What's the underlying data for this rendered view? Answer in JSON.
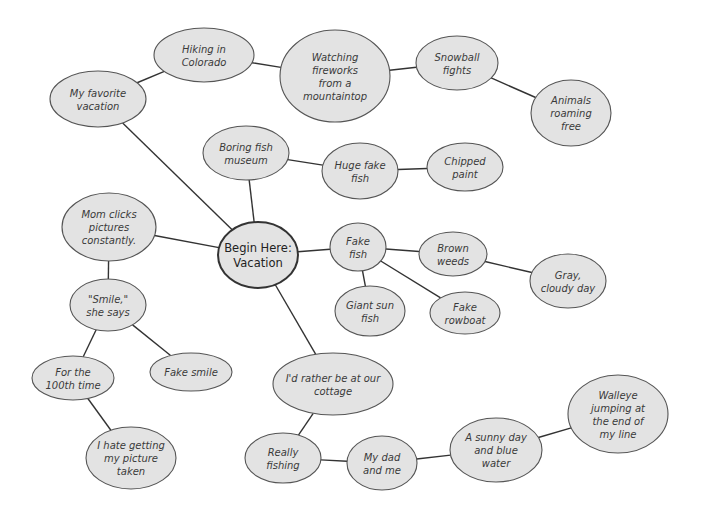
{
  "diagram": {
    "type": "mind-map / cluster web",
    "center_id": "center",
    "colors": {
      "node_fill": "#e3e3e3",
      "node_stroke": "#555555",
      "center_stroke": "#333333",
      "edge": "#333333",
      "text": "#3a3a3a"
    },
    "nodes": [
      {
        "id": "center",
        "lines": [
          "Begin Here:",
          "Vacation"
        ],
        "cx": 258,
        "cy": 255,
        "rx": 40,
        "ry": 33
      },
      {
        "id": "favorite",
        "lines": [
          "My favorite",
          "vacation"
        ],
        "cx": 98,
        "cy": 99,
        "rx": 48,
        "ry": 28
      },
      {
        "id": "hiking",
        "lines": [
          "Hiking in",
          "Colorado"
        ],
        "cx": 204,
        "cy": 55,
        "rx": 50,
        "ry": 27
      },
      {
        "id": "fireworks",
        "lines": [
          "Watching",
          "fireworks",
          "from a",
          "mountaintop"
        ],
        "cx": 335,
        "cy": 76,
        "rx": 55,
        "ry": 46
      },
      {
        "id": "snowball",
        "lines": [
          "Snowball",
          "fights"
        ],
        "cx": 457,
        "cy": 63,
        "rx": 41,
        "ry": 27
      },
      {
        "id": "animals",
        "lines": [
          "Animals",
          "roaming",
          "free"
        ],
        "cx": 571,
        "cy": 113,
        "rx": 40,
        "ry": 33
      },
      {
        "id": "museum",
        "lines": [
          "Boring fish",
          "museum"
        ],
        "cx": 246,
        "cy": 153,
        "rx": 43,
        "ry": 27
      },
      {
        "id": "hugefish",
        "lines": [
          "Huge fake",
          "fish"
        ],
        "cx": 360,
        "cy": 171,
        "rx": 38,
        "ry": 28
      },
      {
        "id": "chipped",
        "lines": [
          "Chipped",
          "paint"
        ],
        "cx": 465,
        "cy": 167,
        "rx": 38,
        "ry": 24
      },
      {
        "id": "fakefish",
        "lines": [
          "Fake",
          "fish"
        ],
        "cx": 358,
        "cy": 247,
        "rx": 28,
        "ry": 24
      },
      {
        "id": "weeds",
        "lines": [
          "Brown",
          "weeds"
        ],
        "cx": 453,
        "cy": 254,
        "rx": 34,
        "ry": 22
      },
      {
        "id": "gray",
        "lines": [
          "Gray,",
          "cloudy day"
        ],
        "cx": 568,
        "cy": 281,
        "rx": 38,
        "ry": 27
      },
      {
        "id": "sunfish",
        "lines": [
          "Giant sun",
          "fish"
        ],
        "cx": 370,
        "cy": 311,
        "rx": 35,
        "ry": 25
      },
      {
        "id": "rowboat",
        "lines": [
          "Fake",
          "rowboat"
        ],
        "cx": 465,
        "cy": 313,
        "rx": 35,
        "ry": 21
      },
      {
        "id": "mom",
        "lines": [
          "Mom clicks",
          "pictures",
          "constantly."
        ],
        "cx": 109,
        "cy": 227,
        "rx": 47,
        "ry": 34
      },
      {
        "id": "smile",
        "lines": [
          "\"Smile,\"",
          "she says"
        ],
        "cx": 108,
        "cy": 305,
        "rx": 38,
        "ry": 26
      },
      {
        "id": "hundredth",
        "lines": [
          "For the",
          "100th time"
        ],
        "cx": 73,
        "cy": 378,
        "rx": 41,
        "ry": 22
      },
      {
        "id": "fakesmile",
        "lines": [
          "Fake smile"
        ],
        "cx": 191,
        "cy": 372,
        "rx": 41,
        "ry": 19
      },
      {
        "id": "hate",
        "lines": [
          "I hate getting",
          "my picture",
          "taken"
        ],
        "cx": 131,
        "cy": 458,
        "rx": 45,
        "ry": 31
      },
      {
        "id": "cottage",
        "lines": [
          "I'd rather be at our",
          "cottage"
        ],
        "cx": 333,
        "cy": 384,
        "rx": 60,
        "ry": 31
      },
      {
        "id": "really",
        "lines": [
          "Really",
          "fishing"
        ],
        "cx": 283,
        "cy": 458,
        "rx": 38,
        "ry": 25
      },
      {
        "id": "dad",
        "lines": [
          "My dad",
          "and me"
        ],
        "cx": 382,
        "cy": 463,
        "rx": 35,
        "ry": 27
      },
      {
        "id": "sunny",
        "lines": [
          "A sunny day",
          "and blue",
          "water"
        ],
        "cx": 496,
        "cy": 450,
        "rx": 46,
        "ry": 32
      },
      {
        "id": "walleye",
        "lines": [
          "Walleye",
          "jumping at",
          "the end of",
          "my line"
        ],
        "cx": 618,
        "cy": 414,
        "rx": 50,
        "ry": 39
      }
    ],
    "edges": [
      [
        "center",
        "favorite"
      ],
      [
        "favorite",
        "hiking"
      ],
      [
        "hiking",
        "fireworks"
      ],
      [
        "fireworks",
        "snowball"
      ],
      [
        "snowball",
        "animals"
      ],
      [
        "center",
        "museum"
      ],
      [
        "museum",
        "hugefish"
      ],
      [
        "hugefish",
        "chipped"
      ],
      [
        "center",
        "fakefish"
      ],
      [
        "fakefish",
        "weeds"
      ],
      [
        "weeds",
        "gray"
      ],
      [
        "fakefish",
        "sunfish"
      ],
      [
        "fakefish",
        "rowboat"
      ],
      [
        "center",
        "mom"
      ],
      [
        "mom",
        "smile"
      ],
      [
        "smile",
        "hundredth"
      ],
      [
        "smile",
        "fakesmile"
      ],
      [
        "hundredth",
        "hate"
      ],
      [
        "center",
        "cottage"
      ],
      [
        "cottage",
        "really"
      ],
      [
        "really",
        "dad"
      ],
      [
        "dad",
        "sunny"
      ],
      [
        "sunny",
        "walleye"
      ]
    ]
  }
}
